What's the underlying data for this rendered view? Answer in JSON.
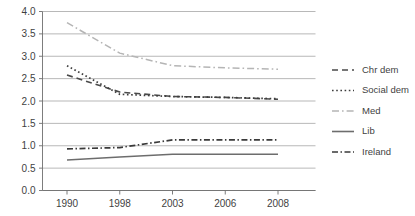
{
  "chart_data": {
    "type": "line",
    "title": "",
    "subtitle": "",
    "xlabel": "",
    "ylabel": "",
    "x": [
      1990,
      1998,
      2003,
      2006,
      2008
    ],
    "categories": [
      "1990",
      "1998",
      "2003",
      "2006",
      "2008"
    ],
    "xtick_labels": [
      "1990",
      "1998",
      "2003",
      "2006",
      "2008"
    ],
    "ytick_labels": [
      "0.0",
      "0.5",
      "1.0",
      "1.5",
      "2.0",
      "2.5",
      "3.0",
      "3.5",
      "4.0"
    ],
    "ytick_values": [
      0.0,
      0.5,
      1.0,
      1.5,
      2.0,
      2.5,
      3.0,
      3.5,
      4.0
    ],
    "ylim": [
      0.0,
      4.0
    ],
    "grid": "horizontal",
    "legend_position": "right",
    "series": [
      {
        "name": "Chr dem",
        "values": [
          2.58,
          2.2,
          2.1,
          2.08,
          2.04
        ],
        "style": "dashed",
        "color": "#4a4a4a",
        "dasharray": "6,4",
        "width": 1.6
      },
      {
        "name": "Social dem",
        "values": [
          2.79,
          2.15,
          2.1,
          2.08,
          2.05
        ],
        "style": "dotted",
        "color": "#3d3d3d",
        "dasharray": "1.6,2.6",
        "width": 1.7
      },
      {
        "name": "Med",
        "values": [
          3.75,
          3.07,
          2.79,
          2.74,
          2.71
        ],
        "style": "dash-dot",
        "color": "#b5b5b5",
        "dasharray": "7,3,1.6,3",
        "width": 1.5
      },
      {
        "name": "Lib",
        "values": [
          0.68,
          0.75,
          0.81,
          0.81,
          0.81
        ],
        "style": "solid",
        "color": "#6d6d6d",
        "dasharray": "none",
        "width": 1.6
      },
      {
        "name": "Ireland",
        "values": [
          0.93,
          0.96,
          1.13,
          1.13,
          1.13
        ],
        "style": "dash-dot",
        "color": "#3a3a3a",
        "dasharray": "6,2.5,1.5,2.5",
        "width": 1.7
      }
    ]
  },
  "legend": {
    "items": [
      {
        "label": "Chr dem"
      },
      {
        "label": "Social dem"
      },
      {
        "label": "Med"
      },
      {
        "label": "Lib"
      },
      {
        "label": "Ireland"
      }
    ]
  },
  "axes": {
    "y": {
      "labels": [
        "4.0",
        "3.5",
        "3.0",
        "2.5",
        "2.0",
        "1.5",
        "1.0",
        "0.5",
        "0.0"
      ]
    },
    "x": {
      "labels": [
        "1990",
        "1998",
        "2003",
        "2006",
        "2008"
      ]
    }
  }
}
